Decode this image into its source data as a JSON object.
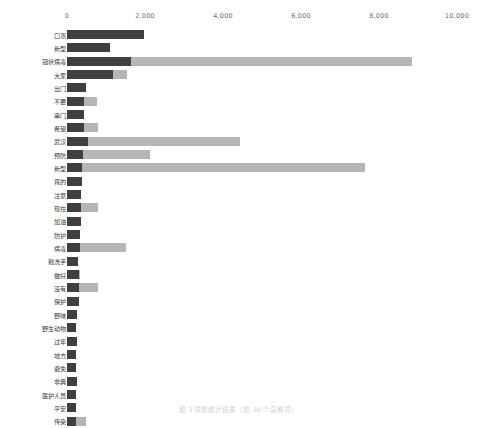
{
  "chart_data": {
    "type": "bar",
    "orientation": "horizontal",
    "title": "",
    "subtitle": "",
    "xlabel": "",
    "ylabel": "",
    "xlim": [
      0,
      10000
    ],
    "grid": false,
    "legend": "none",
    "tick_labels": [
      "0",
      "2,000",
      "4,000",
      "6,000",
      "8,000",
      "10,000"
    ],
    "tick_values": [
      0,
      2000,
      4000,
      6000,
      8000,
      10000
    ],
    "categories": [
      "口罩",
      "新型",
      "冠状病毒",
      "大家",
      "出门",
      "不要",
      "串门",
      "希望",
      "武汉",
      "预防",
      "新型",
      "真的",
      "注意",
      "现在",
      "加油",
      "防护",
      "病毒",
      "勤洗手",
      "做好",
      "没有",
      "保护",
      "野味",
      "野生动物",
      "过年",
      "地方",
      "避免",
      "非典",
      "医护人员",
      "平安",
      "传染"
    ],
    "series": [
      {
        "name": "背景序列",
        "color": "#b5b5b5",
        "values": [
          1980,
          1100,
          8850,
          1550,
          480,
          760,
          430,
          800,
          4430,
          2130,
          7650,
          380,
          360,
          800,
          360,
          330,
          1500,
          280,
          330,
          800,
          310,
          260,
          240,
          250,
          240,
          230,
          250,
          240,
          230,
          480
        ]
      },
      {
        "name": "前景序列",
        "color": "#3f3f3f",
        "values": [
          1980,
          1100,
          1650,
          1170,
          480,
          430,
          430,
          430,
          530,
          400,
          380,
          380,
          360,
          360,
          360,
          330,
          330,
          280,
          300,
          300,
          300,
          260,
          240,
          250,
          240,
          230,
          250,
          240,
          230,
          230
        ]
      }
    ]
  },
  "caption": {
    "text": "图 3  词频统计结果（前 30 个高频词）"
  }
}
